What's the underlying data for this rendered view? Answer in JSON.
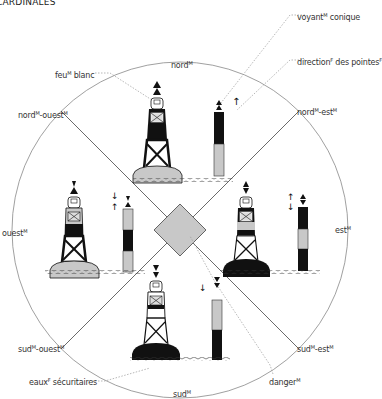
{
  "title": "CARDINALES",
  "labels": {
    "feu_blanc": {
      "text": "feu",
      "sup": "M",
      "rest": " blanc"
    },
    "voyant_conique": {
      "text": "voyant",
      "sup": "M",
      "rest": " conique"
    },
    "direction_pointes": {
      "text": "direction",
      "sup": "F",
      "rest": " des pointes",
      "sup2": "F"
    },
    "nord": {
      "text": "nord",
      "sup": "M"
    },
    "nord_ouest": {
      "text": "nord",
      "sup": "M",
      "rest": "-ouest",
      "sup2": "M"
    },
    "nord_est": {
      "text": "nord",
      "sup": "M",
      "rest": "-est",
      "sup2": "M"
    },
    "ouest": {
      "text": "ouest",
      "sup": "M"
    },
    "est": {
      "text": "est",
      "sup": "M"
    },
    "sud_ouest": {
      "text": "sud",
      "sup": "M",
      "rest": "-ouest",
      "sup2": "M"
    },
    "sud_est": {
      "text": "sud",
      "sup": "M",
      "rest": "-est",
      "sup2": "M"
    },
    "sud": {
      "text": "sud",
      "sup": "M"
    },
    "eaux_securitaires": {
      "text": "eaux",
      "sup": "F",
      "rest": " sécuritaires"
    },
    "danger": {
      "text": "danger",
      "sup": "M"
    }
  },
  "colors": {
    "black": "#111111",
    "gray": "#c8c8c8",
    "line": "#777777",
    "leader": "#999999"
  },
  "buoys": [
    {
      "direction": "nord",
      "topmark": "both-up",
      "pattern": "black-over-yellow"
    },
    {
      "direction": "ouest",
      "topmark": "points-together",
      "pattern": "yellow-black-yellow"
    },
    {
      "direction": "est",
      "topmark": "bases-together",
      "pattern": "black-yellow-black"
    },
    {
      "direction": "sud",
      "topmark": "both-down",
      "pattern": "yellow-over-black"
    }
  ]
}
